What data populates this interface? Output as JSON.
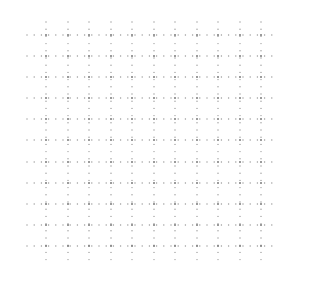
{
  "grid": {
    "background": "#ffffff",
    "dot_color": "#9a9a9a",
    "dot_color_dark": "#7a7a7a",
    "dot_radius": 0.7,
    "columns_x": [
      46,
      68,
      89,
      111,
      132,
      154,
      175,
      197,
      218,
      240,
      261
    ],
    "rows_y": [
      35,
      56,
      77,
      98,
      119,
      140,
      162,
      183,
      204,
      225,
      246
    ],
    "horizontal_extent": [
      27,
      277
    ],
    "vertical_extent": [
      22,
      266
    ],
    "dot_step": 7.2
  }
}
